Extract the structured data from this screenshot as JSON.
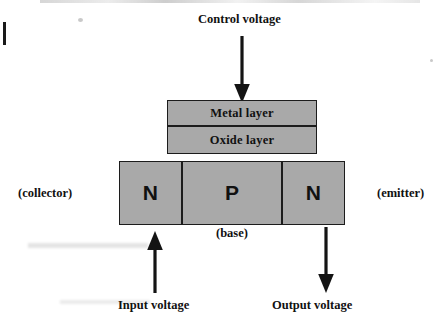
{
  "diagram": {
    "title": "Control voltage",
    "type": "npn-transistor-cross-section",
    "fill_color": "#a9a9a9",
    "stroke_color": "#1c1c1c",
    "background_color": "#ffffff",
    "layers": [
      {
        "id": "metal",
        "label": "Metal layer"
      },
      {
        "id": "oxide",
        "label": "Oxide layer"
      }
    ],
    "regions": [
      {
        "id": "collector-region",
        "label": "N"
      },
      {
        "id": "base-region",
        "label": "P"
      },
      {
        "id": "emitter-region",
        "label": "N"
      }
    ],
    "annotations": {
      "collector": "(collector)",
      "base": "(base)",
      "emitter": "(emitter)"
    },
    "signals": [
      {
        "id": "control-voltage",
        "label": "Control voltage",
        "direction": "down"
      },
      {
        "id": "input-voltage",
        "label": "Input voltage",
        "direction": "up"
      },
      {
        "id": "output-voltage",
        "label": "Output voltage",
        "direction": "down"
      }
    ],
    "arrows": {
      "control": {
        "label": "control-voltage-arrow",
        "direction": "down"
      },
      "input": {
        "label": "input-voltage-arrow",
        "direction": "up"
      },
      "output": {
        "label": "output-voltage-arrow",
        "direction": "down"
      }
    }
  }
}
